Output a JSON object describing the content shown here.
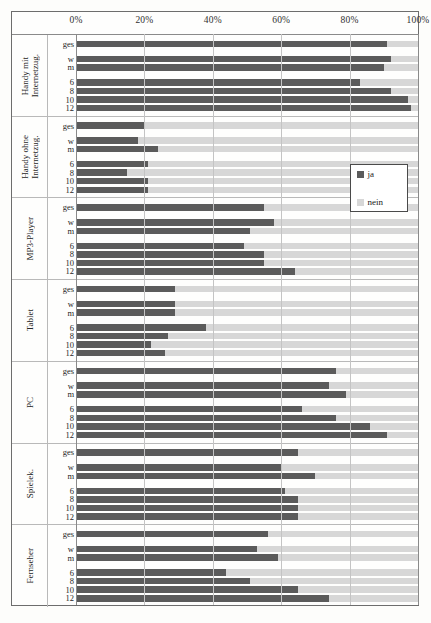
{
  "figure": {
    "legend": {
      "position": "inside-right-upper",
      "entries": [
        {
          "label": "ja",
          "color": "#5b5b5b"
        },
        {
          "label": "nein",
          "color": "#d7d7d7"
        }
      ]
    },
    "caption": ""
  },
  "colors": {
    "ja": "#5b5b5b",
    "nein": "#d7d7d7",
    "frame": "#6d6d6d",
    "grid": "#c4c4c4",
    "page": "#fdfdfb"
  },
  "chart_data": {
    "type": "bar",
    "orientation": "horizontal",
    "stacked": true,
    "title": "",
    "xlabel": "",
    "ylabel": "",
    "xlim": [
      0,
      100
    ],
    "xticks": [
      "0%",
      "20%",
      "40%",
      "60%",
      "80%",
      "100%"
    ],
    "xtick_values": [
      0,
      20,
      40,
      60,
      80,
      100
    ],
    "grid": true,
    "series": [
      {
        "name": "ja",
        "color": "#5b5b5b"
      },
      {
        "name": "nein",
        "color": "#d7d7d7"
      }
    ],
    "groups": [
      {
        "label": "Handy mit\nInternetzug.",
        "rows": [
          {
            "label": "ges",
            "ja": 91,
            "nein": 9
          },
          {
            "label": "w",
            "ja": 92,
            "nein": 8
          },
          {
            "label": "m",
            "ja": 90,
            "nein": 10
          },
          {
            "label": "6",
            "ja": 83,
            "nein": 17
          },
          {
            "label": "8",
            "ja": 92,
            "nein": 8
          },
          {
            "label": "10",
            "ja": 97,
            "nein": 3
          },
          {
            "label": "12",
            "ja": 98,
            "nein": 2
          }
        ]
      },
      {
        "label": "Handy ohne\nInternetzug.",
        "rows": [
          {
            "label": "ges",
            "ja": 20,
            "nein": 80
          },
          {
            "label": "w",
            "ja": 18,
            "nein": 82
          },
          {
            "label": "m",
            "ja": 24,
            "nein": 76
          },
          {
            "label": "6",
            "ja": 21,
            "nein": 79
          },
          {
            "label": "8",
            "ja": 15,
            "nein": 85
          },
          {
            "label": "10",
            "ja": 21,
            "nein": 79
          },
          {
            "label": "12",
            "ja": 21,
            "nein": 79
          }
        ]
      },
      {
        "label": "MP3-Player",
        "rows": [
          {
            "label": "ges",
            "ja": 55,
            "nein": 45
          },
          {
            "label": "w",
            "ja": 58,
            "nein": 42
          },
          {
            "label": "m",
            "ja": 51,
            "nein": 49
          },
          {
            "label": "6",
            "ja": 49,
            "nein": 51
          },
          {
            "label": "8",
            "ja": 55,
            "nein": 45
          },
          {
            "label": "10",
            "ja": 55,
            "nein": 45
          },
          {
            "label": "12",
            "ja": 64,
            "nein": 36
          }
        ]
      },
      {
        "label": "Tablet",
        "rows": [
          {
            "label": "ges",
            "ja": 29,
            "nein": 71
          },
          {
            "label": "w",
            "ja": 29,
            "nein": 71
          },
          {
            "label": "m",
            "ja": 29,
            "nein": 71
          },
          {
            "label": "6",
            "ja": 38,
            "nein": 62
          },
          {
            "label": "8",
            "ja": 27,
            "nein": 73
          },
          {
            "label": "10",
            "ja": 22,
            "nein": 78
          },
          {
            "label": "12",
            "ja": 26,
            "nein": 74
          }
        ]
      },
      {
        "label": "PC",
        "rows": [
          {
            "label": "ges",
            "ja": 76,
            "nein": 24
          },
          {
            "label": "w",
            "ja": 74,
            "nein": 26
          },
          {
            "label": "m",
            "ja": 79,
            "nein": 21
          },
          {
            "label": "6",
            "ja": 66,
            "nein": 34
          },
          {
            "label": "8",
            "ja": 76,
            "nein": 24
          },
          {
            "label": "10",
            "ja": 86,
            "nein": 14
          },
          {
            "label": "12",
            "ja": 91,
            "nein": 9
          }
        ]
      },
      {
        "label": "Spielek.",
        "rows": [
          {
            "label": "ges",
            "ja": 65,
            "nein": 35
          },
          {
            "label": "w",
            "ja": 60,
            "nein": 40
          },
          {
            "label": "m",
            "ja": 70,
            "nein": 30
          },
          {
            "label": "6",
            "ja": 61,
            "nein": 39
          },
          {
            "label": "8",
            "ja": 65,
            "nein": 35
          },
          {
            "label": "10",
            "ja": 65,
            "nein": 35
          },
          {
            "label": "12",
            "ja": 65,
            "nein": 35
          }
        ]
      },
      {
        "label": "Fernseher",
        "rows": [
          {
            "label": "ges",
            "ja": 56,
            "nein": 44
          },
          {
            "label": "w",
            "ja": 53,
            "nein": 47
          },
          {
            "label": "m",
            "ja": 59,
            "nein": 41
          },
          {
            "label": "6",
            "ja": 44,
            "nein": 56
          },
          {
            "label": "8",
            "ja": 51,
            "nein": 49
          },
          {
            "label": "10",
            "ja": 65,
            "nein": 35
          },
          {
            "label": "12",
            "ja": 74,
            "nein": 26
          }
        ]
      }
    ]
  }
}
